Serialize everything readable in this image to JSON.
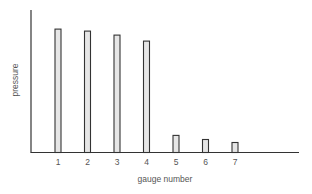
{
  "chart_data": {
    "type": "bar",
    "title": "",
    "xlabel": "gauge number",
    "ylabel": "pressure",
    "categories": [
      "1",
      "2",
      "3",
      "4",
      "5",
      "6",
      "7"
    ],
    "values": [
      123,
      121,
      117,
      111,
      17,
      13,
      10
    ],
    "ylim": [
      0,
      142
    ],
    "y_ticks": [],
    "grid": false,
    "legend": null,
    "colors": {
      "bar_fill": "#e6e6e6",
      "bar_stroke": "#333333",
      "axis": "#333333",
      "text": "#555555"
    }
  }
}
